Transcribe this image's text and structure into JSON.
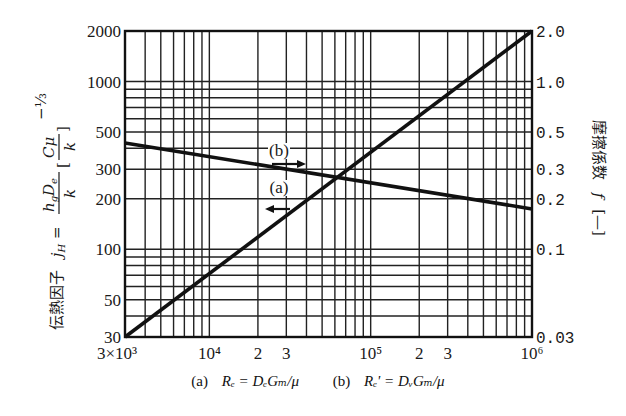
{
  "chart_data": {
    "type": "line",
    "title": "",
    "xscale": "log",
    "yscale": "log",
    "xlim": [
      3000,
      1000000
    ],
    "ylim": [
      30,
      2000
    ],
    "y2lim": [
      0.03,
      2.0
    ],
    "grid": true,
    "x_ticks": [
      {
        "value": 3000,
        "label": "3×10³"
      },
      {
        "value": 10000,
        "label": "10⁴"
      },
      {
        "value": 20000,
        "label": "2"
      },
      {
        "value": 30000,
        "label": "3"
      },
      {
        "value": 100000,
        "label": "10⁵"
      },
      {
        "value": 200000,
        "label": "2"
      },
      {
        "value": 300000,
        "label": "3"
      },
      {
        "value": 1000000,
        "label": "10⁶"
      }
    ],
    "y_ticks": [
      {
        "value": 2000,
        "label": "2000"
      },
      {
        "value": 1000,
        "label": "1000"
      },
      {
        "value": 500,
        "label": "500"
      },
      {
        "value": 300,
        "label": "300"
      },
      {
        "value": 200,
        "label": "200"
      },
      {
        "value": 100,
        "label": "100"
      },
      {
        "value": 50,
        "label": "50"
      },
      {
        "value": 30,
        "label": "30"
      }
    ],
    "y2_ticks": [
      {
        "value": 2.0,
        "label": "2.0"
      },
      {
        "value": 1.0,
        "label": "1.0"
      },
      {
        "value": 0.5,
        "label": "0.5"
      },
      {
        "value": 0.3,
        "label": "0.3"
      },
      {
        "value": 0.2,
        "label": "0.2"
      },
      {
        "value": 0.1,
        "label": "0.1"
      },
      {
        "value": 0.03,
        "label": "0.03"
      }
    ],
    "ylabel": "伝熱因子 jH = (hg De / k)(Cμ/k)^(-1/3)",
    "y2label": "摩擦係数 f [—]",
    "xlabel": "(a) Re = De Gm / μ    (b) Re' = Dv Gm / μ",
    "series": [
      {
        "name": "jH (a)",
        "axis": "left",
        "x": [
          3000,
          1000000
        ],
        "y": [
          30,
          2000
        ],
        "annotation": "(a)",
        "arrow": "left"
      },
      {
        "name": "f (b)",
        "axis": "right",
        "x": [
          3000,
          1000000
        ],
        "y": [
          0.43,
          0.174
        ],
        "annotation": "(b)",
        "arrow": "right"
      }
    ],
    "intersection": {
      "x": 62700,
      "y_left": 272,
      "y_right": 0.272
    }
  },
  "labels": {
    "ylabel_prefix": "伝熱因子",
    "y2label_main": "摩擦係数",
    "y2label_f": "f",
    "y2label_unit": "[—]",
    "annotation_a": "(a)",
    "annotation_b": "(b)",
    "caption_a_tag": "(a)",
    "caption_a_formula": "Rₑ = DₑGₘ/μ",
    "caption_b_tag": "(b)",
    "caption_b_formula": "Rₑ' = DᵥGₘ/μ"
  }
}
